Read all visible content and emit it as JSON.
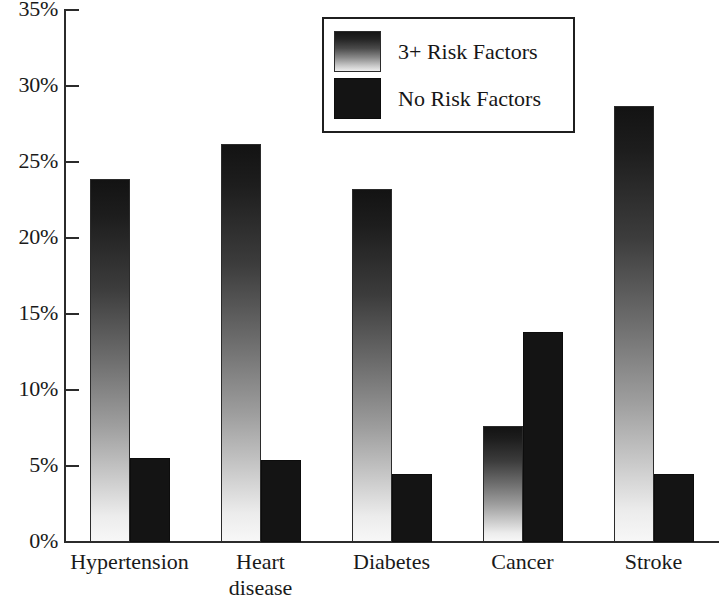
{
  "chart_data": {
    "type": "bar",
    "title": "",
    "xlabel": "",
    "ylabel": "",
    "categories": [
      "Hypertension",
      "Heart\ndisease",
      "Diabetes",
      "Cancer",
      "Stroke"
    ],
    "series": [
      {
        "name": "3+ Risk Factors",
        "values": [
          23.9,
          26.2,
          23.2,
          7.6,
          28.7
        ],
        "style": "gradient",
        "color": "#3c3c3c"
      },
      {
        "name": "No Risk Factors",
        "values": [
          5.5,
          5.4,
          4.5,
          13.8,
          4.5
        ],
        "style": "solid",
        "color": "#141414"
      }
    ],
    "ylim": [
      0,
      35
    ],
    "yticks": [
      0,
      5,
      10,
      15,
      20,
      25,
      30,
      35
    ],
    "ytick_labels": [
      "0%",
      "5%",
      "10%",
      "15%",
      "20%",
      "25%",
      "30%",
      "35%"
    ],
    "grid": false,
    "legend_position": "top-center",
    "value_suffix": "%"
  },
  "legend": {
    "entries": [
      {
        "label": "3+ Risk Factors"
      },
      {
        "label": "No Risk Factors"
      }
    ]
  }
}
